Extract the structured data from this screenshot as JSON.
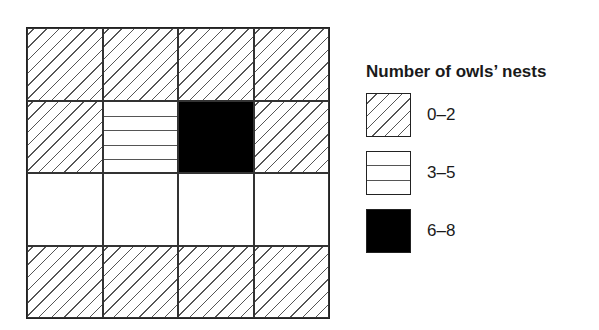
{
  "legend": {
    "title": "Number of owls’ nests",
    "items": [
      {
        "pattern": "diagonal-hatch",
        "label": "0–2"
      },
      {
        "pattern": "horizontal-lines",
        "label": "3–5"
      },
      {
        "pattern": "solid-black",
        "label": "6–8"
      }
    ]
  },
  "grid": {
    "rows": 4,
    "cols": 4,
    "cells": [
      [
        "diagonal-hatch",
        "diagonal-hatch",
        "diagonal-hatch",
        "diagonal-hatch"
      ],
      [
        "diagonal-hatch",
        "horizontal-lines",
        "solid-black",
        "diagonal-hatch"
      ],
      [
        "blank",
        "blank",
        "blank",
        "blank"
      ],
      [
        "diagonal-hatch",
        "diagonal-hatch",
        "diagonal-hatch",
        "diagonal-hatch"
      ]
    ]
  }
}
